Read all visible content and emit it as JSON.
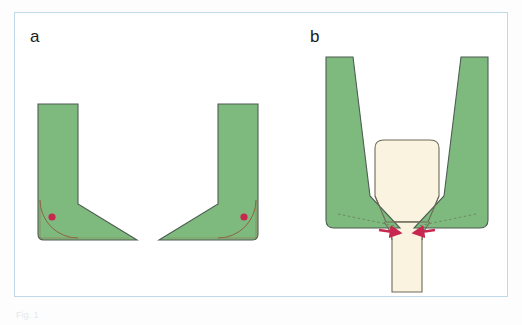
{
  "figure": {
    "type": "scientific-schematic-diagram",
    "page_background": "#fdfdfd",
    "frame": {
      "border_color": "#bfd9e8",
      "fill": "#ffffff",
      "x": 14,
      "y": 12,
      "width": 494,
      "height": 285
    },
    "caption_partial_text": "Fig. 1",
    "panels": [
      {
        "id": "a",
        "label": "a",
        "label_x": 30,
        "label_y": 28,
        "description": "Two mirrored L-shaped (boot-like) green members facing each other, each with a quarter-circle fillet arc at the inner bottom corner and a small red pivot dot"
      },
      {
        "id": "b",
        "label": "b",
        "label_x": 310,
        "label_y": 28,
        "description": "Two slanted green arms converging to sharp tips at a cream-colored waisted body, with dashed construction lines inside the arms and two red arrows pointing inward at the contact point"
      }
    ],
    "colors": {
      "green_fill": "#7eb97e",
      "green_edge": "#4e5d52",
      "cream_fill": "#f9f3e0",
      "cream_edge": "#6f6a58",
      "red_accent": "#c8284f",
      "arc_line": "#8d5b3a",
      "dash_line": "#6f8a5f",
      "frame_border": "#bfd9e8"
    },
    "annotations": {
      "pivot_dot_label": "pivot point",
      "arrow_label": "applied force direction",
      "arc_label": "fillet radius construction arc",
      "dash_label": "taper construction line"
    }
  }
}
